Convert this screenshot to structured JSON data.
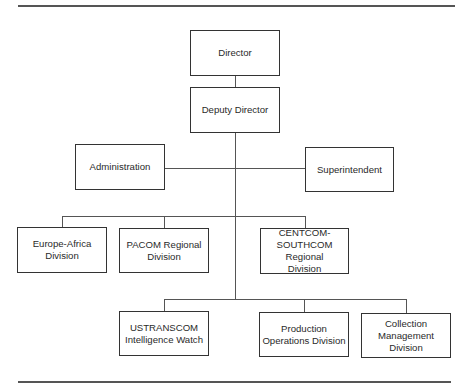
{
  "org_chart": {
    "director": "Director",
    "deputy_director": "Deputy Director",
    "staff": {
      "left": "Administration",
      "right": "Superintendent"
    },
    "divisions_row1": [
      "Europe-Africa Division",
      "PACOM Regional Division",
      "CENTCOM-SOUTHCOM Regional Division"
    ],
    "divisions_row2": [
      "USTRANSCOM Intelligence Watch",
      "Production Operations Division",
      "Collection Management Division"
    ]
  }
}
